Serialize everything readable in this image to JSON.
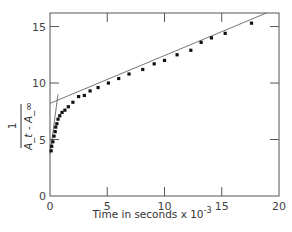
{
  "chart_data": {
    "type": "scatter",
    "title": "",
    "xlabel": "Time in seconds x 10^-3",
    "xlabel_main": "Time in seconds x 10",
    "xlabel_exp": "-3",
    "ylabel": "1 / (A_t - A_inf)",
    "ylabel_num": "1",
    "ylabel_den": "A_t - A_∞",
    "xlim": [
      0,
      20
    ],
    "ylim": [
      0,
      16.2
    ],
    "xticks": [
      0,
      5,
      10,
      15,
      20
    ],
    "yticks": [
      0,
      5,
      10,
      15
    ],
    "grid": false,
    "legend": null,
    "series": [
      {
        "name": "observed",
        "marker": "filled-square",
        "x": [
          0.1,
          0.15,
          0.25,
          0.35,
          0.45,
          0.5,
          0.6,
          0.7,
          0.85,
          1.05,
          1.3,
          1.6,
          2.0,
          2.5,
          3.0,
          3.5,
          4.2,
          5.1,
          6.0,
          6.9,
          8.1,
          9.1,
          10.0,
          11.1,
          12.3,
          13.2,
          14.1,
          15.3,
          17.6
        ],
        "y": [
          4.0,
          4.4,
          4.8,
          5.3,
          5.7,
          6.1,
          6.4,
          6.8,
          7.1,
          7.4,
          7.6,
          7.9,
          8.3,
          8.8,
          8.9,
          9.3,
          9.6,
          10.0,
          10.4,
          10.8,
          11.2,
          11.7,
          12.0,
          12.5,
          12.9,
          13.6,
          14.0,
          14.4,
          15.3
        ]
      }
    ],
    "fit_lines": [
      {
        "name": "slow-phase fit",
        "x": [
          0,
          18.9
        ],
        "y": [
          8.2,
          16.2
        ]
      },
      {
        "name": "fast-phase fit",
        "x": [
          0,
          0.7
        ],
        "y": [
          3.7,
          9.0
        ]
      }
    ],
    "colors": {
      "points": "#111111",
      "axes": "#555555",
      "lines": "#666666"
    }
  }
}
